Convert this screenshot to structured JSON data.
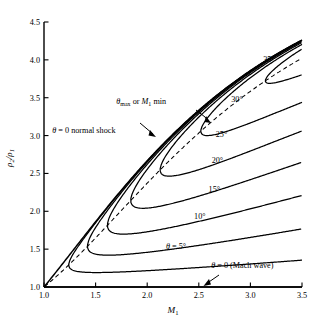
{
  "chart_data": {
    "type": "line",
    "title": "",
    "xlabel": "M1",
    "ylabel": "rho2/rho1",
    "xlim": [
      1.0,
      3.5
    ],
    "ylim": [
      1.0,
      4.5
    ],
    "grid": false,
    "legend_position": "inline-labels",
    "xticks": [
      "1.0",
      "1.5",
      "2.0",
      "2.5",
      "3.0",
      "3.5"
    ],
    "xtick_values": [
      1.0,
      1.5,
      2.0,
      2.5,
      3.0,
      3.5
    ],
    "yticks": [
      "1.0",
      "1.5",
      "2.0",
      "2.5",
      "3.0",
      "3.5",
      "4.0",
      "4.5"
    ],
    "ytick_values": [
      1.0,
      1.5,
      2.0,
      2.5,
      3.0,
      3.5,
      4.0,
      4.5
    ],
    "gamma": 1.4,
    "series": [
      {
        "name": "theta = 0 normal shock",
        "theta_deg": 0,
        "style": "solid",
        "x": [
          1.0,
          1.2,
          1.4,
          1.6,
          1.8,
          2.0,
          2.2,
          2.4,
          2.6,
          2.8,
          3.0,
          3.2,
          3.5
        ],
        "values": [
          1.0,
          1.34,
          1.69,
          2.03,
          2.36,
          2.67,
          2.95,
          3.21,
          3.44,
          3.66,
          3.86,
          4.03,
          4.26
        ]
      },
      {
        "name": "35 deg",
        "theta_deg": 35,
        "style": "solid",
        "nose": [
          3.1,
          3.73
        ],
        "x_end": 3.5,
        "y_end_upper": 4.19,
        "y_end_lower": 3.8
      },
      {
        "name": "30 deg",
        "theta_deg": 30,
        "style": "solid",
        "nose": [
          2.52,
          3.03
        ],
        "x_end": 3.5,
        "y_end_upper": 4.22,
        "y_end_lower": 3.44
      },
      {
        "name": "25 deg",
        "theta_deg": 25,
        "style": "solid",
        "nose": [
          2.12,
          2.52
        ],
        "x_end": 3.5,
        "y_end_upper": 4.24,
        "y_end_lower": 3.06
      },
      {
        "name": "20 deg",
        "theta_deg": 20,
        "style": "solid",
        "nose": [
          1.84,
          2.12
        ],
        "x_end": 3.5,
        "y_end_upper": 4.25,
        "y_end_lower": 2.7
      },
      {
        "name": "15 deg",
        "theta_deg": 15,
        "style": "solid",
        "nose": [
          1.62,
          1.78
        ],
        "x_end": 3.5,
        "y_end_upper": 4.25,
        "y_end_lower": 2.22
      },
      {
        "name": "10 deg",
        "theta_deg": 10,
        "style": "solid",
        "nose": [
          1.43,
          1.49
        ],
        "x_end": 3.5,
        "y_end_upper": 4.26,
        "y_end_lower": 1.78
      },
      {
        "name": "theta = 5 deg",
        "theta_deg": 5,
        "style": "solid",
        "nose": [
          1.25,
          1.2
        ],
        "x_end": 3.5,
        "y_end_upper": 4.26,
        "y_end_lower": 1.35
      },
      {
        "name": "theta max or M1 min locus",
        "style": "dashed",
        "x": [
          1.0,
          1.25,
          1.43,
          1.62,
          1.84,
          2.12,
          2.52,
          3.1,
          3.5
        ],
        "values": [
          1.0,
          1.2,
          1.49,
          1.78,
          2.12,
          2.52,
          3.03,
          3.73,
          4.05
        ]
      },
      {
        "name": "theta = 0 Mach wave",
        "theta_deg": 0,
        "style": "solid",
        "x": [
          1.0,
          3.5
        ],
        "values": [
          1.0,
          1.0
        ]
      }
    ],
    "curve_labels": [
      {
        "text": "35°",
        "x": 3.18,
        "y": 3.97
      },
      {
        "text": "30°",
        "x": 2.87,
        "y": 3.45
      },
      {
        "text": "25°",
        "x": 2.72,
        "y": 2.98
      },
      {
        "text": "20°",
        "x": 2.68,
        "y": 2.64
      },
      {
        "text": "15°",
        "x": 2.65,
        "y": 2.25
      },
      {
        "text": "10°",
        "x": 2.51,
        "y": 1.9
      }
    ],
    "annotations": [
      {
        "name": "theta-max-annotation",
        "text_parts": [
          "θ",
          "max",
          " or ",
          "M",
          "1",
          " min"
        ],
        "x": 1.72,
        "y": 3.43
      },
      {
        "name": "normal-shock-annotation",
        "text_parts": [
          "θ",
          " = 0 normal shock"
        ],
        "x": 1.36,
        "y": 3.05
      },
      {
        "name": "theta-5-label",
        "text_parts": [
          "θ",
          " = 5°"
        ],
        "x": 2.32,
        "y": 1.5
      },
      {
        "name": "mach-wave-label",
        "text_parts": [
          "θ",
          " = 0 (Mach wave)"
        ],
        "x": 2.62,
        "y": 1.26
      }
    ],
    "axis_label_x": "M1",
    "axis_label_y": "ρ2/ρ1"
  },
  "labels": {
    "x_axis": "M",
    "x_axis_sub": "1",
    "y_axis_num": "ρ",
    "y_axis_num_sub": "2",
    "y_axis_slash": "/",
    "y_axis_den": "ρ",
    "y_axis_den_sub": "1",
    "theta_max_1": "θ",
    "theta_max_sub": "max",
    "theta_max_or": " or ",
    "theta_max_m": "M",
    "theta_max_m_sub": "1",
    "theta_max_min": " min",
    "normal_shock_theta": "θ",
    "normal_shock_rest": " = 0 normal shock",
    "theta5_theta": "θ",
    "theta5_rest": " = 5°",
    "mach_theta": "θ",
    "mach_rest": " = 0 (Mach wave)",
    "deg35": "35°",
    "deg30": "30°",
    "deg25": "25°",
    "deg20": "20°",
    "deg15": "15°",
    "deg10": "10°",
    "tick_x_1": "1.0",
    "tick_x_2": "1.5",
    "tick_x_3": "2.0",
    "tick_x_4": "2.5",
    "tick_x_5": "3.0",
    "tick_x_6": "3.5",
    "tick_y_1": "1.0",
    "tick_y_2": "1.5",
    "tick_y_3": "2.0",
    "tick_y_4": "2.5",
    "tick_y_5": "3.0",
    "tick_y_6": "3.5",
    "tick_y_7": "4.0",
    "tick_y_8": "4.5"
  },
  "colors": {
    "ink": "#000000",
    "background": "#ffffff"
  }
}
